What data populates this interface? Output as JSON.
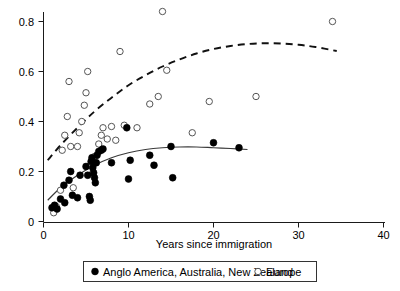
{
  "chart_data": {
    "type": "scatter",
    "title": "",
    "xlabel": "Years since immigration",
    "ylabel": "",
    "xlim": [
      0,
      40
    ],
    "ylim": [
      0,
      0.88
    ],
    "grid": false,
    "legend_position": "bottom",
    "xticks": [
      0,
      10,
      20,
      30,
      40
    ],
    "xtick_labels": [
      "0",
      "10",
      "20",
      "30",
      "40"
    ],
    "yticks": [
      0,
      0.2,
      0.4,
      0.6,
      0.8
    ],
    "ytick_labels": [
      "0",
      "0.2",
      "0.4",
      "0.6",
      "0.8"
    ],
    "series": [
      {
        "name": "Anglo America, Australia, New Zealand",
        "marker": "filled-circle",
        "color": "#000000",
        "points": [
          [
            1.0,
            0.055
          ],
          [
            1.3,
            0.065
          ],
          [
            1.6,
            0.05
          ],
          [
            2.0,
            0.09
          ],
          [
            2.4,
            0.145
          ],
          [
            2.5,
            0.075
          ],
          [
            3.0,
            0.165
          ],
          [
            3.2,
            0.2
          ],
          [
            3.4,
            0.105
          ],
          [
            4.0,
            0.095
          ],
          [
            4.3,
            0.185
          ],
          [
            5.0,
            0.22
          ],
          [
            5.2,
            0.185
          ],
          [
            5.4,
            0.1
          ],
          [
            5.5,
            0.085
          ],
          [
            5.6,
            0.24
          ],
          [
            5.7,
            0.255
          ],
          [
            5.8,
            0.215
          ],
          [
            5.9,
            0.195
          ],
          [
            6.0,
            0.175
          ],
          [
            6.1,
            0.155
          ],
          [
            6.2,
            0.235
          ],
          [
            6.3,
            0.265
          ],
          [
            6.5,
            0.28
          ],
          [
            6.8,
            0.285
          ],
          [
            7.0,
            0.29
          ],
          [
            8.0,
            0.235
          ],
          [
            9.8,
            0.375
          ],
          [
            10.0,
            0.17
          ],
          [
            10.2,
            0.245
          ],
          [
            12.5,
            0.265
          ],
          [
            13.0,
            0.225
          ],
          [
            15.0,
            0.3
          ],
          [
            15.2,
            0.175
          ],
          [
            20.0,
            0.315
          ],
          [
            23.0,
            0.295
          ]
        ]
      },
      {
        "name": "Europe",
        "marker": "open-circle",
        "color": "#555555",
        "points": [
          [
            1.2,
            0.035
          ],
          [
            1.5,
            0.06
          ],
          [
            2.0,
            0.125
          ],
          [
            2.2,
            0.285
          ],
          [
            2.5,
            0.345
          ],
          [
            2.8,
            0.42
          ],
          [
            3.0,
            0.56
          ],
          [
            3.2,
            0.3
          ],
          [
            3.5,
            0.135
          ],
          [
            4.0,
            0.3
          ],
          [
            4.2,
            0.355
          ],
          [
            4.5,
            0.4
          ],
          [
            4.8,
            0.465
          ],
          [
            5.0,
            0.515
          ],
          [
            5.2,
            0.6
          ],
          [
            5.5,
            0.225
          ],
          [
            5.8,
            0.195
          ],
          [
            6.0,
            0.26
          ],
          [
            6.2,
            0.235
          ],
          [
            6.5,
            0.31
          ],
          [
            6.8,
            0.345
          ],
          [
            7.0,
            0.375
          ],
          [
            7.5,
            0.33
          ],
          [
            8.0,
            0.38
          ],
          [
            8.5,
            0.325
          ],
          [
            9.0,
            0.68
          ],
          [
            9.5,
            0.385
          ],
          [
            11.0,
            0.375
          ],
          [
            12.5,
            0.47
          ],
          [
            13.5,
            0.5
          ],
          [
            14.0,
            0.84
          ],
          [
            14.5,
            0.605
          ],
          [
            17.5,
            0.355
          ],
          [
            19.5,
            0.48
          ],
          [
            25.0,
            0.5
          ],
          [
            34.0,
            0.8
          ]
        ]
      }
    ],
    "fits": [
      {
        "name": "Anglo America, Australia, New Zealand fit",
        "style": "solid",
        "x_range": [
          0.5,
          24.0
        ],
        "curve": [
          [
            0.5,
            0.085
          ],
          [
            2.0,
            0.135
          ],
          [
            4.0,
            0.185
          ],
          [
            6.0,
            0.225
          ],
          [
            8.0,
            0.255
          ],
          [
            10.0,
            0.275
          ],
          [
            12.0,
            0.288
          ],
          [
            14.0,
            0.295
          ],
          [
            16.0,
            0.298
          ],
          [
            18.0,
            0.298
          ],
          [
            20.0,
            0.295
          ],
          [
            22.0,
            0.292
          ],
          [
            24.0,
            0.288
          ]
        ]
      },
      {
        "name": "Europe fit",
        "style": "dashed",
        "x_range": [
          0.5,
          34.5
        ],
        "curve": [
          [
            0.5,
            0.245
          ],
          [
            2.0,
            0.305
          ],
          [
            4.0,
            0.375
          ],
          [
            6.0,
            0.44
          ],
          [
            8.0,
            0.495
          ],
          [
            10.0,
            0.545
          ],
          [
            12.0,
            0.585
          ],
          [
            14.0,
            0.62
          ],
          [
            16.0,
            0.648
          ],
          [
            18.0,
            0.672
          ],
          [
            20.0,
            0.69
          ],
          [
            22.0,
            0.702
          ],
          [
            24.0,
            0.71
          ],
          [
            26.0,
            0.713
          ],
          [
            28.0,
            0.712
          ],
          [
            30.0,
            0.707
          ],
          [
            32.0,
            0.698
          ],
          [
            34.5,
            0.682
          ]
        ]
      }
    ],
    "legend": [
      {
        "label": "Anglo America, Australia, New Zealand",
        "marker": "filled-circle"
      },
      {
        "label": "Europe",
        "marker": "open-circle"
      }
    ]
  }
}
